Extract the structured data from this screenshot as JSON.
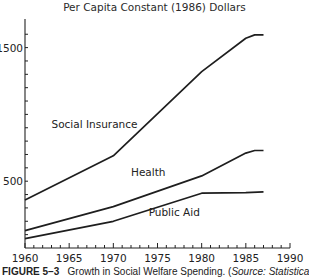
{
  "chart_data": {
    "type": "line",
    "title": "Per Capita Constant (1986) Dollars",
    "xlabel": "",
    "ylabel": "",
    "x": [
      1960,
      1965,
      1970,
      1975,
      1980,
      1985,
      1987
    ],
    "xlim": [
      1960,
      1990
    ],
    "ylim": [
      0,
      1700
    ],
    "x_ticks": [
      1960,
      1965,
      1970,
      1975,
      1980,
      1985,
      1990
    ],
    "y_tick_labels": [
      500,
      1500
    ],
    "y_minor_step": 100,
    "grid": false,
    "legend": "inline labels",
    "series": [
      {
        "name": "Social Insurance",
        "points": [
          [
            1960,
            360
          ],
          [
            1970,
            690
          ],
          [
            1980,
            1320
          ],
          [
            1985,
            1570
          ],
          [
            1986,
            1595
          ],
          [
            1987,
            1595
          ]
        ]
      },
      {
        "name": "Health",
        "points": [
          [
            1960,
            130
          ],
          [
            1970,
            310
          ],
          [
            1980,
            540
          ],
          [
            1985,
            710
          ],
          [
            1986,
            730
          ],
          [
            1987,
            730
          ]
        ]
      },
      {
        "name": "Public Aid",
        "points": [
          [
            1960,
            70
          ],
          [
            1970,
            200
          ],
          [
            1980,
            410
          ],
          [
            1985,
            415
          ],
          [
            1987,
            420
          ]
        ]
      }
    ],
    "annotations": [
      {
        "text": "Social Insurance",
        "x": 1963,
        "y": 900
      },
      {
        "text": "Health",
        "x": 1972,
        "y": 540
      },
      {
        "text": "Public Aid",
        "x": 1974,
        "y": 240
      }
    ]
  },
  "caption": {
    "label": "FIGURE 5–3",
    "text": "Growth in Social Welfare Spending. (",
    "source_italic": "Source: Statistical"
  }
}
